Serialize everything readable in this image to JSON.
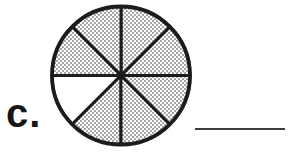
{
  "worksheet": {
    "item_label": "c.",
    "answer_blank_value": ""
  },
  "diagram": {
    "type": "fraction-circle",
    "total_parts": 8,
    "shaded_parts": 7,
    "unshaded_parts": 1,
    "shaded_fraction": "7/8",
    "sectors": [
      {
        "start_deg": 0,
        "end_deg": 45,
        "shaded": true
      },
      {
        "start_deg": 45,
        "end_deg": 90,
        "shaded": true
      },
      {
        "start_deg": 90,
        "end_deg": 135,
        "shaded": true
      },
      {
        "start_deg": 135,
        "end_deg": 180,
        "shaded": true
      },
      {
        "start_deg": 180,
        "end_deg": 225,
        "shaded": false
      },
      {
        "start_deg": 225,
        "end_deg": 270,
        "shaded": true
      },
      {
        "start_deg": 270,
        "end_deg": 315,
        "shaded": true
      },
      {
        "start_deg": 315,
        "end_deg": 360,
        "shaded": true
      }
    ],
    "geometry": {
      "cx": 121,
      "cy": 75.5,
      "r": 69,
      "sector_stroke_width": 3,
      "outline_stroke_width": 3.8
    },
    "colors": {
      "stroke": "#1c1c1c",
      "stipple_dot": "#9a9a9a",
      "stipple_background": "#ffffff",
      "unshaded_fill": "#ffffff"
    }
  }
}
